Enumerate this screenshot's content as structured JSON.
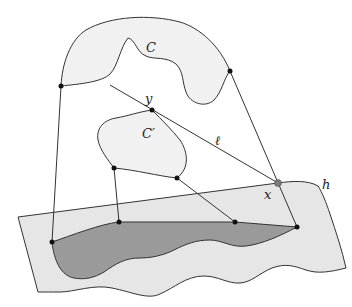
{
  "diagram": {
    "type": "geometric-projection",
    "labels": {
      "C": "C",
      "C_prime": "C′",
      "y": "y",
      "ell": "ℓ",
      "x": "x",
      "h": "h"
    },
    "colors": {
      "plane_fill": "#e6e6e6",
      "shadow_fill": "#9a9a9a",
      "region_fill": "#f1f1f1",
      "stroke": "#333333",
      "x_point": "#7a7a7a"
    },
    "points": {
      "C_left": [
        61,
        86
      ],
      "C_right": [
        230,
        71
      ],
      "y": [
        152,
        110
      ],
      "x": [
        278,
        183
      ],
      "Cp_left": [
        114,
        168
      ],
      "Cp_right": [
        177,
        178
      ],
      "shadow_left": [
        52,
        242
      ],
      "shadow_mid1": [
        119,
        222
      ],
      "shadow_mid2": [
        235,
        222
      ],
      "shadow_right": [
        297,
        227
      ]
    }
  }
}
